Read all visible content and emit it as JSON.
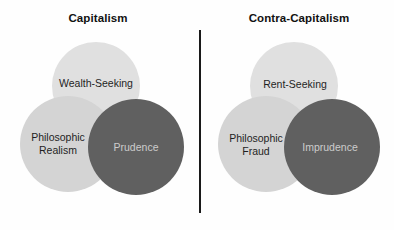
{
  "colors": {
    "background": "#fefefe",
    "circle_light_top": "#e0e0e0",
    "circle_light_side": "#d4d4d4",
    "circle_dark": "#606060",
    "label_dark_text": "#1f1f1f",
    "label_light_text": "#cccccc",
    "title_text": "#111111",
    "divider": "#1a1a1a"
  },
  "left": {
    "title": "Capitalism",
    "top_circle_label": "Wealth-Seeking",
    "left_circle_label_line1": "Philosophic",
    "left_circle_label_line2": "Realism",
    "right_circle_label": "Prudence"
  },
  "right": {
    "title": "Contra-Capitalism",
    "top_circle_label": "Rent-Seeking",
    "left_circle_label_line1": "Philosophic",
    "left_circle_label_line2": "Fraud",
    "right_circle_label": "Imprudence"
  }
}
